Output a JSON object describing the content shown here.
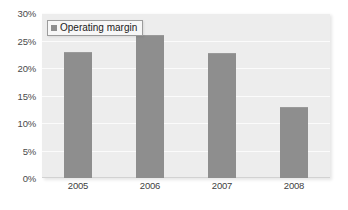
{
  "chart_data": {
    "type": "bar",
    "title": "",
    "xlabel": "",
    "ylabel": "",
    "categories": [
      "2005",
      "2006",
      "2007",
      "2008"
    ],
    "series": [
      {
        "name": "Operating margin",
        "values": [
          23,
          26,
          22.8,
          13
        ]
      }
    ],
    "ylim": [
      0,
      30
    ],
    "ytick_values": [
      0,
      5,
      10,
      15,
      20,
      25,
      30
    ],
    "ytick_labels": [
      "0%",
      "5%",
      "10%",
      "15%",
      "20%",
      "25%",
      "30%"
    ],
    "grid": true,
    "legend_position": "top-left",
    "colors": {
      "bar_fill": "#8e8e8e",
      "plot_background": "#ededed",
      "gridline": "#fbfbfb",
      "page_background": "#ffffff",
      "tick_label": "#4a4a4a",
      "legend_border": "#9c9c9c",
      "legend_background": "#f7f7f7"
    }
  },
  "legend": {
    "entries": [
      {
        "label": "Operating margin",
        "swatch_name": "legend-swatch-operating-margin"
      }
    ]
  }
}
